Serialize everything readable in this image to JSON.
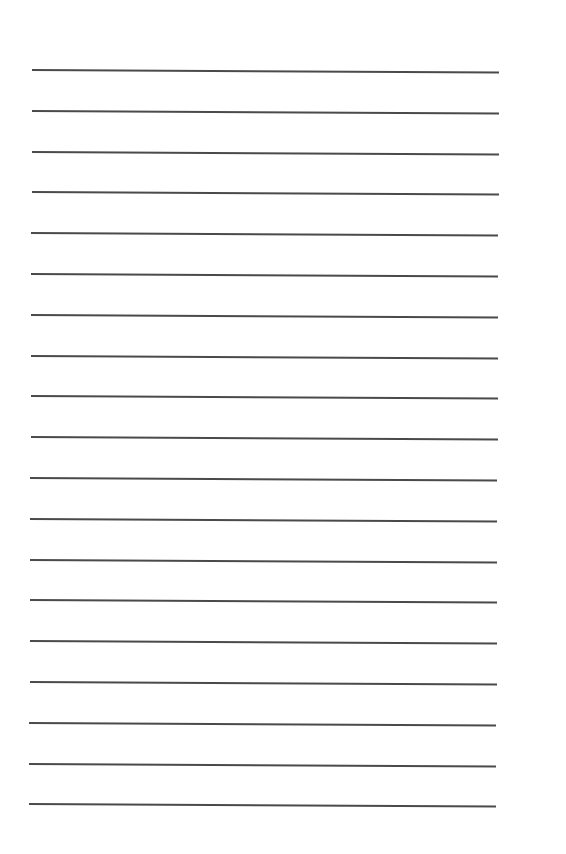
{
  "page": {
    "type": "lined-paper",
    "background_color": "#ffffff",
    "line_color": "#4a4a4a",
    "line_count": 19,
    "first_line_y": 69,
    "line_spacing": 40.8,
    "line_left_x": 32,
    "line_right_x": 499,
    "line_slant_px": 2.5
  }
}
